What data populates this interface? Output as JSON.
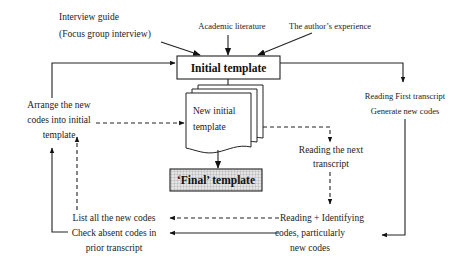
{
  "diagram": {
    "inputs": {
      "interview_guide_line1": "Interview guide",
      "interview_guide_line2": "(Focus group interview)",
      "academic_literature": "Academic literature",
      "author_experience": "The author’s experience"
    },
    "nodes": {
      "initial_template": "Initial template",
      "new_initial_template_line1": "New initial",
      "new_initial_template_line2": "template",
      "final_template": "‘Final’ template",
      "reading_first_line1": "Reading First transcript",
      "reading_first_line2": "Generate new codes",
      "reading_next_line1": "Reading the next",
      "reading_next_line2": "transcript",
      "reading_identifying_line1": "Reading + Identifying",
      "reading_identifying_line2": "codes, particularly",
      "reading_identifying_line3": "new codes",
      "list_codes_line1": "List all the new codes",
      "list_codes_line2": "Check absent codes in",
      "list_codes_line3": "prior transcript",
      "arrange_line1": "Arrange the new",
      "arrange_line2": "codes into initial",
      "arrange_line3": "template"
    },
    "colors": {
      "stroke": "#222222",
      "final_fill": "#d9d9d9",
      "background": "#ffffff"
    }
  }
}
